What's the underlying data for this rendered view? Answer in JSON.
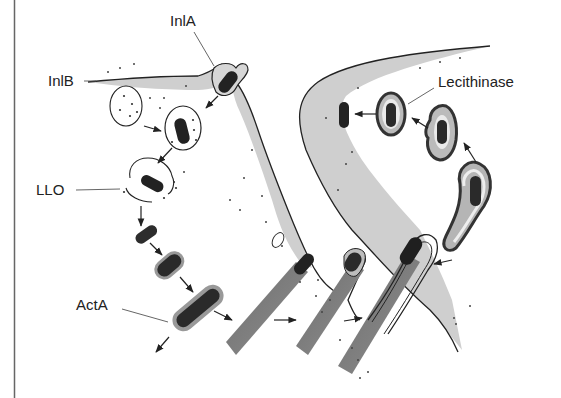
{
  "figure": {
    "labels": {
      "inla": "InlA",
      "inlb": "InlB",
      "llo": "LLO",
      "acta": "ActA",
      "lecithinase": "Lecithinase"
    },
    "colors": {
      "background": "#ffffff",
      "cytoplasm": "#c9c9c9",
      "bacterium": "#2a2a2a",
      "actin_tail": "#7d7d7d",
      "vacuole_ring": "#8a8a8a",
      "membrane": "#222222",
      "border": "#666666"
    },
    "stages": [
      "entry via InlA/InlB",
      "vacuole",
      "LLO-mediated vacuole escape",
      "cytosolic replication",
      "ActA-driven actin tail",
      "protrusion into neighbour cell",
      "double-membrane vacuole",
      "lecithinase-mediated escape"
    ]
  }
}
